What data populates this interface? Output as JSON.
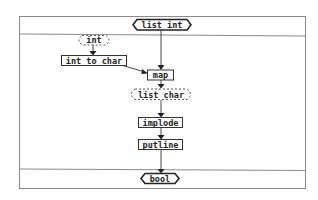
{
  "diagram": {
    "type": "dataflow",
    "input_type": "list int",
    "output_type": "bool",
    "nodes": [
      {
        "id": "input",
        "label": "list int",
        "shape": "hexagon"
      },
      {
        "id": "int",
        "label": "int",
        "shape": "dashed-ellipse"
      },
      {
        "id": "int_to_char",
        "label": "int to char",
        "shape": "box"
      },
      {
        "id": "map",
        "label": "map",
        "shape": "box"
      },
      {
        "id": "list_char",
        "label": "list char",
        "shape": "dashed-ellipse"
      },
      {
        "id": "implode",
        "label": "implode",
        "shape": "box"
      },
      {
        "id": "putline",
        "label": "putline",
        "shape": "box"
      },
      {
        "id": "output",
        "label": "bool",
        "shape": "hexagon"
      }
    ],
    "edges": [
      {
        "from": "int",
        "to": "int_to_char"
      },
      {
        "from": "int_to_char",
        "to": "map"
      },
      {
        "from": "input",
        "to": "map"
      },
      {
        "from": "map",
        "to": "list_char"
      },
      {
        "from": "list_char",
        "to": "implode"
      },
      {
        "from": "implode",
        "to": "putline"
      },
      {
        "from": "putline",
        "to": "output"
      }
    ]
  }
}
